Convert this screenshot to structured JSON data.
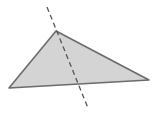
{
  "diagram": {
    "type": "geometry",
    "triangle": {
      "vertices": {
        "top": [
          56,
          31
        ],
        "bottom_left": [
          9,
          88
        ],
        "right": [
          149,
          80
        ]
      },
      "fill": "#d4d4d4",
      "stroke": "#6b6b6b"
    },
    "dashed_line": {
      "start": [
        47,
        7
      ],
      "end": [
        88,
        108
      ],
      "stroke": "#555555"
    },
    "background": "#ffffff"
  }
}
